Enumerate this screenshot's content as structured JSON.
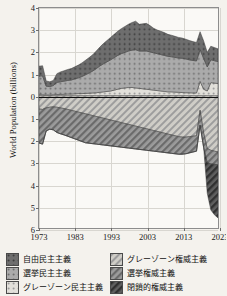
{
  "chart_data": {
    "type": "area",
    "title": "",
    "xlabel": "",
    "ylabel": "World Population (billions)",
    "xlim": [
      1973,
      2023
    ],
    "ylim": [
      -6,
      4
    ],
    "grid": true,
    "legend_position": "below",
    "xticks": [
      "1973",
      "1983",
      "1993",
      "2003",
      "2013",
      "2023"
    ],
    "yticks": [
      "4",
      "3",
      "2",
      "1",
      "0",
      "1",
      "2",
      "3",
      "4",
      "5",
      "6"
    ],
    "ytick_values": [
      4,
      3,
      2,
      1,
      0,
      -1,
      -2,
      -3,
      -4,
      -5,
      -6
    ],
    "note": "Diverging stacked area: democracies plotted upward (positive), autocracies downward (negative).",
    "x": [
      1973,
      1974,
      1975,
      1976,
      1977,
      1978,
      1979,
      1980,
      1981,
      1982,
      1983,
      1984,
      1985,
      1986,
      1987,
      1988,
      1989,
      1990,
      1991,
      1992,
      1993,
      1994,
      1995,
      1996,
      1997,
      1998,
      1999,
      2000,
      2001,
      2002,
      2003,
      2004,
      2005,
      2006,
      2007,
      2008,
      2009,
      2010,
      2011,
      2012,
      2013,
      2014,
      2015,
      2016,
      2017,
      2018,
      2019,
      2020,
      2021,
      2022,
      2023
    ],
    "series": [
      {
        "name": "自由民主主義",
        "direction": "up",
        "color": "#6e6e6e",
        "pattern": "dots-dark",
        "values": [
          0.45,
          0.46,
          0.24,
          0.22,
          0.23,
          0.4,
          0.45,
          0.47,
          0.5,
          0.52,
          0.55,
          0.58,
          0.62,
          0.66,
          0.7,
          0.74,
          0.8,
          0.86,
          0.92,
          0.97,
          1.02,
          1.06,
          1.1,
          1.14,
          1.18,
          1.22,
          1.26,
          1.3,
          1.22,
          1.24,
          1.26,
          1.2,
          1.12,
          1.08,
          1.06,
          1.04,
          1.0,
          0.98,
          0.96,
          0.94,
          0.92,
          0.9,
          0.88,
          0.86,
          0.84,
          0.82,
          0.8,
          0.66,
          0.62,
          0.6,
          0.58
        ]
      },
      {
        "name": "選挙民主主義",
        "direction": "up",
        "color": "#a5a5a5",
        "pattern": "dots-mid",
        "values": [
          0.85,
          0.86,
          0.4,
          0.38,
          0.42,
          0.55,
          0.58,
          0.6,
          0.62,
          0.64,
          0.68,
          0.72,
          0.78,
          0.85,
          0.92,
          1.0,
          1.1,
          1.2,
          1.28,
          1.35,
          1.42,
          1.48,
          1.54,
          1.58,
          1.62,
          1.66,
          1.7,
          1.74,
          1.7,
          1.72,
          1.74,
          1.72,
          1.7,
          1.68,
          1.66,
          1.64,
          1.62,
          1.6,
          1.58,
          1.56,
          1.56,
          1.54,
          1.5,
          1.48,
          1.46,
          1.44,
          1.4,
          1.1,
          1.04,
          1.02,
          1.0
        ]
      },
      {
        "name": "グレーゾーン民主主義",
        "direction": "up",
        "color": "#d8d8d8",
        "pattern": "dots-light",
        "values": [
          0.05,
          0.05,
          0.04,
          0.04,
          0.05,
          0.06,
          0.06,
          0.07,
          0.08,
          0.08,
          0.09,
          0.1,
          0.1,
          0.11,
          0.12,
          0.13,
          0.14,
          0.16,
          0.18,
          0.2,
          0.22,
          0.26,
          0.3,
          0.34,
          0.36,
          0.38,
          0.38,
          0.36,
          0.34,
          0.32,
          0.3,
          0.28,
          0.26,
          0.24,
          0.22,
          0.2,
          0.18,
          0.18,
          0.17,
          0.16,
          0.15,
          0.14,
          0.14,
          0.13,
          0.13,
          0.66,
          0.3,
          0.22,
          0.6,
          0.58,
          0.56
        ]
      },
      {
        "name": "グレーゾーン権威主義",
        "direction": "down",
        "color": "#c9c9c9",
        "pattern": "hatch-light",
        "values": [
          0.6,
          0.62,
          0.55,
          0.52,
          0.5,
          0.52,
          0.55,
          0.58,
          0.62,
          0.66,
          0.7,
          0.74,
          0.78,
          0.82,
          0.86,
          0.9,
          0.94,
          0.98,
          1.02,
          1.06,
          1.1,
          1.14,
          1.18,
          1.22,
          1.26,
          1.3,
          1.34,
          1.38,
          1.42,
          1.46,
          1.5,
          1.54,
          1.58,
          1.62,
          1.66,
          1.7,
          1.74,
          1.78,
          1.82,
          1.86,
          1.88,
          1.88,
          1.86,
          1.84,
          1.82,
          0.66,
          1.7,
          2.4,
          2.48,
          2.52,
          2.56
        ]
      },
      {
        "name": "選挙権威主義",
        "direction": "down",
        "color": "#8f8f8f",
        "pattern": "hatch-mid",
        "values": [
          1.55,
          1.58,
          1.05,
          1.0,
          1.05,
          1.15,
          1.18,
          1.2,
          1.22,
          1.24,
          1.26,
          1.28,
          1.3,
          1.32,
          1.3,
          1.28,
          1.26,
          1.24,
          1.22,
          1.2,
          1.18,
          1.16,
          1.14,
          1.12,
          1.1,
          1.08,
          1.06,
          1.04,
          1.02,
          1.0,
          0.98,
          0.96,
          0.94,
          0.92,
          0.9,
          0.88,
          0.86,
          0.84,
          0.82,
          0.8,
          0.78,
          0.76,
          0.74,
          0.72,
          0.7,
          0.68,
          0.66,
          0.64,
          0.62,
          0.6,
          0.58
        ]
      },
      {
        "name": "閉鎖的権威主義",
        "direction": "down",
        "color": "#5b5b5b",
        "pattern": "hatch-dark",
        "values": [
          0.0,
          0.0,
          0.0,
          0.0,
          0.0,
          0.0,
          0.0,
          0.0,
          0.0,
          0.0,
          0.0,
          0.0,
          0.0,
          0.0,
          0.0,
          0.0,
          0.0,
          0.0,
          0.0,
          0.0,
          0.0,
          0.0,
          0.0,
          0.0,
          0.0,
          0.0,
          0.0,
          0.0,
          0.0,
          0.0,
          0.0,
          0.0,
          0.0,
          0.0,
          0.0,
          0.0,
          0.0,
          0.0,
          0.0,
          0.0,
          0.0,
          0.0,
          0.0,
          0.0,
          0.0,
          0.0,
          0.0,
          1.4,
          2.1,
          2.3,
          2.42
        ]
      }
    ]
  },
  "legend": {
    "items": [
      {
        "label": "自由民主主義",
        "swatch": "dots-dark",
        "column": "left"
      },
      {
        "label": "選挙民主主義",
        "swatch": "dots-mid",
        "column": "left"
      },
      {
        "label": "グレーゾーン民主主義",
        "swatch": "dots-light",
        "column": "left"
      },
      {
        "label": "グレーゾーン権威主義",
        "swatch": "hatch-light",
        "column": "right"
      },
      {
        "label": "選挙権威主義",
        "swatch": "hatch-mid",
        "column": "right"
      },
      {
        "label": "閉鎖的権威主義",
        "swatch": "hatch-dark",
        "column": "right"
      }
    ]
  }
}
